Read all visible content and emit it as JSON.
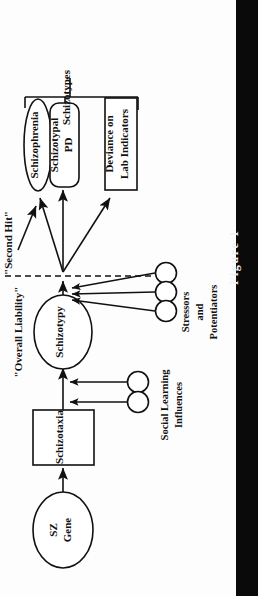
{
  "figure": {
    "caption": "Figure 1",
    "orientation": "rotated-90-ccw",
    "band_color": "#0a0a0a",
    "ink_color": "#111111",
    "paper_color": "#fdfdfd"
  },
  "diagram": {
    "type": "causal-path-model",
    "nodes": [
      {
        "id": "sz-gene",
        "label": "SZ\nGene",
        "line1": "SZ",
        "line2": "Gene",
        "shape": "ellipse"
      },
      {
        "id": "schizotaxia",
        "label": "Schizotaxia",
        "line1": "Schizotaxia",
        "line2": "",
        "shape": "rectangle"
      },
      {
        "id": "schizotypy",
        "label": "Schizotypy",
        "line1": "Schizotypy",
        "line2": "",
        "shape": "ellipse"
      },
      {
        "id": "schizophrenia",
        "label": "Schizophrenia",
        "line1": "Schizophrenia",
        "line2": "",
        "shape": "ellipse"
      },
      {
        "id": "schizotypal-pd",
        "label": "Schizotypal\nPD",
        "line1": "Schizotypal",
        "line2": "PD",
        "shape": "rounded-rectangle"
      },
      {
        "id": "deviance",
        "label": "Deviance on\nLab Indicators",
        "line1": "Deviance on",
        "line2": "Lab Indicators",
        "shape": "rectangle"
      }
    ],
    "annotations": [
      {
        "id": "overall-liability",
        "text": "\"Overall Liability\""
      },
      {
        "id": "second-hit",
        "text": "\"Second Hit\""
      },
      {
        "id": "schizotypes",
        "text": "Schizotypes"
      }
    ],
    "influence_groups": [
      {
        "id": "social-learning",
        "line1": "Social Learning",
        "line2": "Influences",
        "line3": "",
        "marker_count": 2,
        "target": "schizotaxia-to-schizotypy"
      },
      {
        "id": "stressors-potentiators",
        "line1": "Stressors",
        "line2": "and",
        "line3": "Potentiators",
        "marker_count": 3,
        "target": "outcome-hub"
      }
    ],
    "edges": [
      {
        "from": "sz-gene",
        "to": "schizotaxia",
        "style": "solid-arrow"
      },
      {
        "from": "schizotaxia",
        "to": "schizotypy",
        "style": "solid-arrow"
      },
      {
        "from": "schizotypy",
        "to": "outcome-hub",
        "style": "solid-arrow"
      },
      {
        "from": "outcome-hub",
        "to": "schizophrenia",
        "style": "solid-arrow"
      },
      {
        "from": "outcome-hub",
        "to": "schizotypal-pd",
        "style": "solid-arrow"
      },
      {
        "from": "outcome-hub",
        "to": "deviance",
        "style": "solid-arrow"
      },
      {
        "from": "second-hit",
        "to": "schizophrenia",
        "style": "solid-arrow"
      },
      {
        "from": "threshold",
        "to": "outcome-hub",
        "style": "dashed-line"
      }
    ],
    "bracket": {
      "id": "schizotypes-bracket",
      "label": "Schizotypes",
      "groups": [
        "schizophrenia",
        "schizotypal-pd",
        "deviance"
      ]
    }
  }
}
